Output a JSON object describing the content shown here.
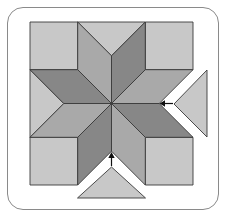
{
  "diagram": {
    "colors": {
      "light": "#c8c8c8",
      "medium": "#a9a9a9",
      "dark": "#878787",
      "stroke": "#3a3a3a",
      "frame": "#8a8a8a"
    },
    "pieces": {
      "corner_squares": 4,
      "setting_triangles": 4,
      "diamonds": 8,
      "detached_triangles": [
        "right",
        "bottom"
      ]
    },
    "arrows": [
      {
        "name": "right-triangle-insert-arrow",
        "direction": "left"
      },
      {
        "name": "bottom-triangle-insert-arrow",
        "direction": "up"
      }
    ]
  }
}
